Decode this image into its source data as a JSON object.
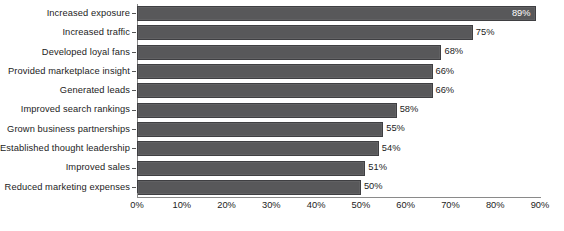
{
  "chart_data": {
    "type": "bar",
    "orientation": "horizontal",
    "title": "",
    "subtitle": "",
    "xlabel": "",
    "ylabel": "",
    "xlim": [
      0,
      90
    ],
    "grid": false,
    "legend": false,
    "bar_color": "#58585a",
    "bar_outline_color": "#3f3f42",
    "background_color": "#ffffff",
    "text_color": "#1c1c1c",
    "axis_color": "#8a8a8a",
    "categories": [
      "Increased exposure",
      "Increased traffic",
      "Developed loyal fans",
      "Provided marketplace insight",
      "Generated leads",
      "Improved search rankings",
      "Grown business partnerships",
      "Established thought leadership",
      "Improved sales",
      "Reduced marketing expenses"
    ],
    "values": [
      89,
      75,
      68,
      66,
      66,
      58,
      55,
      54,
      51,
      50
    ],
    "data_labels": [
      "89%",
      "75%",
      "68%",
      "66%",
      "66%",
      "58%",
      "55%",
      "54%",
      "51%",
      "50%"
    ],
    "data_label_placement": [
      "inside",
      "outside",
      "outside",
      "outside",
      "outside",
      "outside",
      "outside",
      "outside",
      "outside",
      "outside"
    ],
    "xticks": [
      0,
      10,
      20,
      30,
      40,
      50,
      60,
      70,
      80,
      90
    ],
    "xticklabels": [
      "0%",
      "10%",
      "20%",
      "30%",
      "40%",
      "50%",
      "60%",
      "70%",
      "80%",
      "90%"
    ]
  }
}
